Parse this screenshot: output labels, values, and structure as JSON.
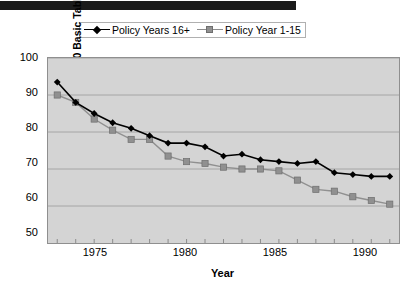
{
  "page": {
    "background_color": "#ffffff",
    "top_bar_color": "#1b1b1b"
  },
  "chart_data": {
    "type": "line",
    "title": "",
    "xlabel": "Year",
    "ylabel": "Percentage of 65-70 Basic Table",
    "xlim": [
      1972.5,
      1991.5
    ],
    "ylim": [
      50,
      100
    ],
    "ytick_step": 10,
    "yticks": [
      50,
      60,
      70,
      80,
      90,
      100
    ],
    "xticks_labeled": [
      1975,
      1980,
      1985,
      1990
    ],
    "xticks_all": [
      1973,
      1974,
      1975,
      1976,
      1977,
      1978,
      1979,
      1980,
      1981,
      1982,
      1983,
      1984,
      1985,
      1986,
      1987,
      1988,
      1989,
      1990,
      1991
    ],
    "grid": true,
    "grid_axis": "y",
    "plot_background": "#d4d4d4",
    "legend_position": "top-center",
    "x": [
      1973,
      1974,
      1975,
      1976,
      1977,
      1978,
      1979,
      1980,
      1981,
      1982,
      1983,
      1984,
      1985,
      1986,
      1987,
      1988,
      1989,
      1990,
      1991
    ],
    "series": [
      {
        "name": "Policy Years 16+",
        "color": "#000000",
        "marker": "diamond",
        "values": [
          93.5,
          88.0,
          85.0,
          82.5,
          81.0,
          79.0,
          77.0,
          77.0,
          76.0,
          73.5,
          74.0,
          72.5,
          72.0,
          71.5,
          72.0,
          69.0,
          68.5,
          68.0,
          68.0
        ]
      },
      {
        "name": "Policy Year  1-15",
        "color": "#909090",
        "marker": "square",
        "values": [
          90.0,
          88.0,
          83.5,
          80.5,
          78.0,
          78.0,
          73.5,
          72.0,
          71.5,
          70.5,
          70.0,
          70.0,
          69.5,
          67.0,
          64.5,
          64.0,
          62.5,
          61.5,
          60.5
        ]
      }
    ]
  },
  "legend": {
    "entries": [
      {
        "label": "Policy Years 16+",
        "marker": "black-diamond-marker"
      },
      {
        "label": "Policy Year  1-15",
        "marker": "gray-square-marker"
      }
    ]
  },
  "axes": {
    "y_title": "Percentage of 65-70 Basic Table",
    "x_title": "Year",
    "y_tick_labels": [
      "100",
      "90",
      "80",
      "70",
      "60",
      "50"
    ],
    "x_tick_labels": [
      "1975",
      "1980",
      "1985",
      "1990"
    ]
  }
}
